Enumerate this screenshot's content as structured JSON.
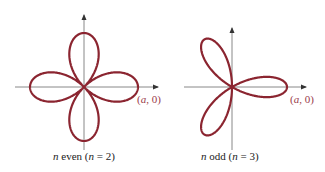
{
  "colors": {
    "curve": "#8b2530",
    "axis": "#7a7a7a",
    "label": "#9a3a4a",
    "caption": "#222222"
  },
  "panels": [
    {
      "id": "even",
      "n": 2,
      "petals": 4,
      "equation_hint": "r = a cos(2θ)",
      "point_label": "(a, 0)",
      "caption": {
        "n_var": "n",
        "word": " even (",
        "n_var2": "n",
        "rest": " = 2)"
      },
      "center": [
        84,
        87
      ],
      "a_px": 54
    },
    {
      "id": "odd",
      "n": 3,
      "petals": 3,
      "equation_hint": "r = a cos(3θ)",
      "point_label": "(a, 0)",
      "caption": {
        "n_var": "n",
        "word": " odd (",
        "n_var2": "n",
        "rest": " = 3)"
      },
      "center": [
        232,
        87
      ],
      "a_px": 55
    }
  ],
  "labels": {
    "left_point": {
      "a": "a",
      "sep": ", 0"
    },
    "right_point": {
      "a": "a",
      "sep": ", 0"
    }
  }
}
